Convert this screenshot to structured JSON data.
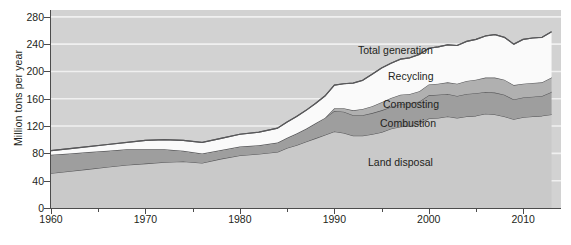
{
  "chart_data": {
    "type": "area",
    "title": "",
    "subtitle": "",
    "xlabel": "",
    "ylabel": "Million tons per year",
    "xlim": [
      1960,
      2014
    ],
    "ylim": [
      0,
      290
    ],
    "grid": true,
    "grid_orientation": "horizontal",
    "legend_position": "inline-annotations",
    "stacked": true,
    "stack_order_bottom_to_top": [
      "Land disposal",
      "Combustion",
      "Composting",
      "Recycling"
    ],
    "x": [
      1960,
      1962,
      1964,
      1966,
      1968,
      1970,
      1972,
      1974,
      1976,
      1978,
      1980,
      1982,
      1984,
      1985,
      1986,
      1987,
      1988,
      1989,
      1990,
      1991,
      1992,
      1993,
      1994,
      1995,
      1996,
      1997,
      1998,
      1999,
      2000,
      2001,
      2002,
      2003,
      2004,
      2005,
      2006,
      2007,
      2008,
      2009,
      2010,
      2011,
      2012,
      2013
    ],
    "series": [
      {
        "name": "Land disposal",
        "color": "#c9c9c9",
        "values": [
          51,
          54,
          57,
          60,
          63,
          65,
          67,
          68,
          66,
          72,
          77,
          79,
          82,
          88,
          92,
          97,
          102,
          107,
          112,
          110,
          106,
          106,
          108,
          111,
          116,
          119,
          120,
          123,
          131,
          132,
          134,
          132,
          134,
          135,
          138,
          137,
          134,
          130,
          133,
          134,
          135,
          137
        ]
      },
      {
        "name": "Combustion",
        "color": "#9e9e9e",
        "values": [
          27,
          26,
          25,
          24,
          23,
          21,
          19,
          16,
          14,
          13,
          13,
          13,
          14,
          15,
          17,
          19,
          22,
          25,
          30,
          31,
          30,
          30,
          31,
          32,
          32,
          33,
          33,
          33,
          34,
          34,
          33,
          32,
          33,
          33,
          32,
          32,
          32,
          29,
          29,
          29,
          29,
          33
        ]
      },
      {
        "name": "Composting",
        "color": "#b0b0b0",
        "values": [
          0,
          0,
          0,
          0,
          0,
          0,
          0,
          0,
          0,
          0,
          0,
          0,
          0,
          0,
          0,
          0,
          0,
          0,
          4,
          5,
          7,
          9,
          10,
          12,
          13,
          14,
          14,
          15,
          16,
          16,
          17,
          18,
          19,
          20,
          21,
          22,
          22,
          21,
          20,
          20,
          20,
          21
        ]
      },
      {
        "name": "Recycling",
        "color": "#fafafa",
        "values": [
          6,
          7,
          8,
          9,
          10,
          13,
          14,
          15,
          16,
          17,
          18,
          19,
          21,
          23,
          25,
          27,
          29,
          32,
          34,
          36,
          40,
          42,
          47,
          50,
          51,
          52,
          53,
          54,
          53,
          54,
          55,
          56,
          58,
          59,
          61,
          63,
          62,
          60,
          65,
          66,
          66,
          67
        ]
      }
    ],
    "total_generation": {
      "name": "Total generation",
      "values": [
        84,
        87,
        90,
        93,
        96,
        99,
        100,
        99,
        96,
        102,
        108,
        111,
        117,
        126,
        134,
        143,
        153,
        164,
        180,
        182,
        183,
        187,
        196,
        205,
        212,
        218,
        220,
        225,
        234,
        236,
        239,
        238,
        244,
        247,
        252,
        254,
        250,
        240,
        247,
        249,
        250,
        258
      ]
    },
    "annotations": [
      {
        "label": "Total generation",
        "x_px": 358,
        "y_px": 44
      },
      {
        "label": "Recycling",
        "x_px": 388,
        "y_px": 70
      },
      {
        "label": "Composting",
        "x_px": 383,
        "y_px": 98
      },
      {
        "label": "Combustion",
        "x_px": 380,
        "y_px": 117
      },
      {
        "label": "Land disposal",
        "x_px": 368,
        "y_px": 156
      }
    ],
    "y_ticks": [
      0,
      40,
      80,
      120,
      160,
      200,
      240,
      280
    ],
    "x_ticks_major": [
      1960,
      1970,
      1980,
      1990,
      2000,
      2010
    ],
    "x_ticks_minor": [
      1965,
      1975,
      1985,
      1995,
      2005
    ],
    "colors": {
      "plot_background": "#d2d2d2",
      "gridline": "#f0f0f0",
      "axis": "#4c4c4c",
      "outline": "#58585a",
      "text": "#231f20"
    }
  }
}
